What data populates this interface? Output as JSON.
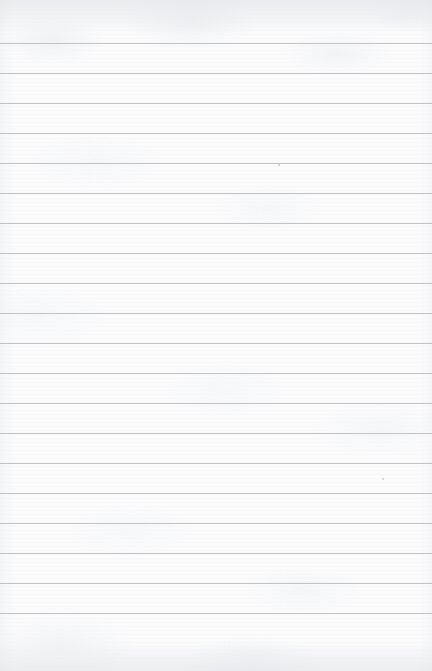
{
  "document": {
    "kind": "scanned-lined-paper",
    "title": "Blank ruled notebook page",
    "written_text": "",
    "page_width": 432,
    "page_height": 671,
    "paper_color": "#fbfbfc",
    "edge_shade_color": "#e0e3e7"
  },
  "ruling": {
    "line_color": "#b9bdc1",
    "line_thickness": 1,
    "line_spacing": 30,
    "first_line_y": 43,
    "last_line_y": 628,
    "line_count": 20,
    "full_bleed": true,
    "has_vertical_margin_rule": false,
    "lines_y": [
      43,
      73,
      103,
      133,
      163,
      193,
      223,
      253,
      283,
      313,
      343,
      373,
      403,
      433,
      463,
      493,
      523,
      553,
      583,
      613
    ]
  },
  "artifacts": {
    "specks": [
      {
        "name": "speck-upper-right",
        "x": 278,
        "y": 164,
        "size": 2.2,
        "color": "#9aa0a6"
      },
      {
        "name": "speck-lower-right",
        "x": 382,
        "y": 478,
        "size": 1.8,
        "color": "#aab0b6"
      }
    ]
  }
}
